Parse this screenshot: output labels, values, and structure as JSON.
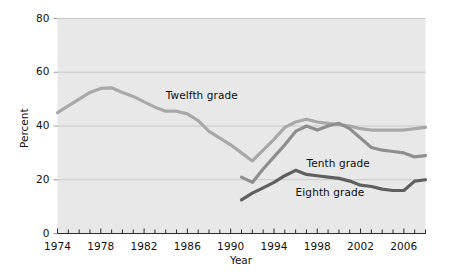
{
  "chart_data": {
    "type": "line",
    "title": "",
    "xlabel": "Year",
    "ylabel": "Percent",
    "xlim": [
      1974,
      2008
    ],
    "ylim": [
      0,
      80
    ],
    "grid": true,
    "legend_position": "inline-annotations",
    "background": "#e8e8e8",
    "x_tick_labels": [
      "1974",
      "1978",
      "1982",
      "1986",
      "1990",
      "1994",
      "1998",
      "2002",
      "2006"
    ],
    "x_tick_values": [
      1974,
      1978,
      1982,
      1986,
      1990,
      1994,
      1998,
      2002,
      2006
    ],
    "x_minor_tick_step": 1,
    "y_tick_labels": [
      "0",
      "20",
      "40",
      "60",
      "80"
    ],
    "y_tick_values": [
      0,
      20,
      40,
      60,
      80
    ],
    "series": [
      {
        "name": "Twelfth grade",
        "color": "#a8a8a8",
        "label_x": 1984,
        "label_y": 51,
        "x": [
          1974,
          1975,
          1976,
          1977,
          1978,
          1979,
          1980,
          1981,
          1982,
          1983,
          1984,
          1985,
          1986,
          1987,
          1988,
          1989,
          1990,
          1991,
          1992,
          1993,
          1994,
          1995,
          1996,
          1997,
          1998,
          1999,
          2000,
          2001,
          2002,
          2003,
          2004,
          2005,
          2006,
          2007,
          2008
        ],
        "y": [
          45.0,
          47.5,
          50.0,
          52.5,
          54.0,
          54.2,
          52.5,
          51.0,
          49.0,
          47.0,
          45.5,
          45.5,
          44.5,
          42.0,
          38.0,
          35.5,
          33.0,
          30.0,
          27.0,
          31.0,
          35.0,
          39.5,
          41.5,
          42.5,
          41.5,
          41.0,
          40.5,
          40.0,
          39.0,
          38.5,
          38.5,
          38.5,
          38.5,
          39.0,
          39.5
        ]
      },
      {
        "name": "Tenth grade",
        "color": "#8e8e8e",
        "label_x": 1997,
        "label_y": 26,
        "x": [
          1991,
          1992,
          1993,
          1994,
          1995,
          1996,
          1997,
          1998,
          1999,
          2000,
          2001,
          2002,
          2003,
          2004,
          2005,
          2006,
          2007,
          2008
        ],
        "y": [
          21.0,
          19.0,
          24.0,
          28.5,
          33.0,
          38.0,
          40.0,
          38.5,
          40.0,
          41.0,
          39.0,
          35.5,
          32.0,
          31.0,
          30.5,
          30.0,
          28.5,
          29.0
        ]
      },
      {
        "name": "Eighth grade",
        "color": "#5f5f5f",
        "label_x": 1996,
        "label_y": 15,
        "x": [
          1991,
          1992,
          1993,
          1994,
          1995,
          1996,
          1997,
          1998,
          1999,
          2000,
          2001,
          2002,
          2003,
          2004,
          2005,
          2006,
          2007,
          2008
        ],
        "y": [
          12.5,
          15.0,
          17.0,
          19.0,
          21.5,
          23.5,
          22.0,
          21.5,
          21.0,
          20.5,
          19.5,
          18.0,
          17.5,
          16.5,
          16.0,
          16.0,
          19.5,
          20.0
        ]
      }
    ]
  }
}
